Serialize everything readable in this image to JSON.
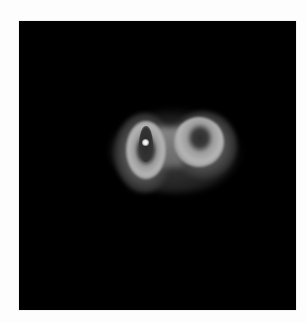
{
  "caption": {
    "text": ""
  },
  "image": {
    "description": "Grayscale intensity image of two adjoining elliptical lobes on a black background",
    "background_color": "#000000",
    "page_color": "#fdfdfd",
    "features": [
      {
        "name": "left-lobe",
        "shape": "vertical ellipse ring",
        "has_bright_center_spot": true
      },
      {
        "name": "right-lobe",
        "shape": "round ring with dark center",
        "has_bright_center_spot": false
      }
    ]
  }
}
